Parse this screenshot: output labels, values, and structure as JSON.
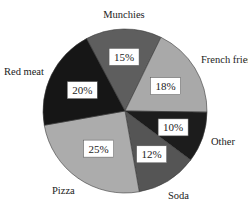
{
  "chart_data": {
    "type": "pie",
    "title": "",
    "categories": [
      "Munchies",
      "French fries",
      "Other",
      "Soda",
      "Pizza",
      "Red meat"
    ],
    "values": [
      15,
      18,
      10,
      12,
      25,
      20
    ],
    "value_labels": [
      "15%",
      "18%",
      "10%",
      "12%",
      "25%",
      "20%"
    ],
    "colors": [
      "#5e5e5e",
      "#a9a9a9",
      "#1c1c1c",
      "#555555",
      "#acacac",
      "#161616"
    ],
    "start_angle_deg": -118,
    "direction": "clockwise",
    "legend": "none (labels placed outside slices)"
  },
  "labels": {
    "munchies": "Munchies",
    "french_fries": "French fries",
    "other": "Other",
    "soda": "Soda",
    "pizza": "Pizza",
    "red_meat": "Red meat"
  }
}
